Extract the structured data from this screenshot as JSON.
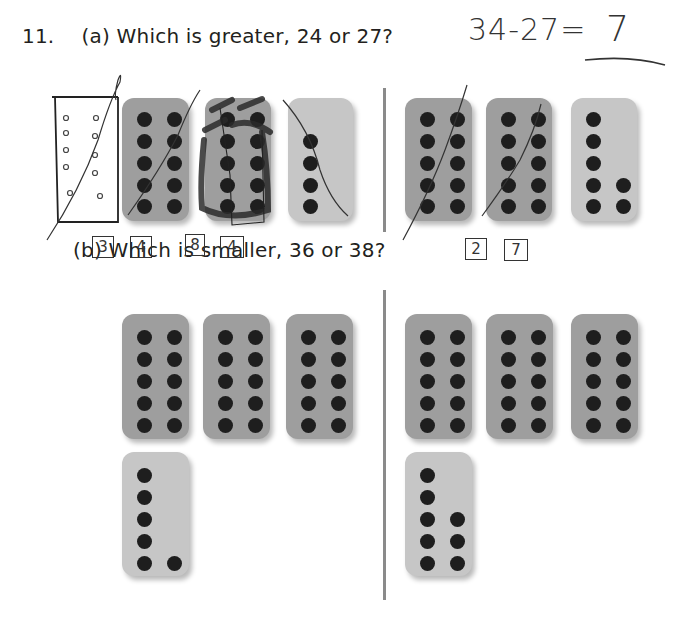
{
  "problem": {
    "number": "11.",
    "part_a": {
      "label": "(a)",
      "question": "Which is greater, 24 or 27?"
    },
    "part_b": {
      "label": "(b)",
      "question": "Which is smaller, 36 or 38?"
    }
  },
  "handwriting": {
    "equation": "34-27=",
    "answer": "7",
    "part_a_left_boxes": [
      "3",
      "4",
      "8",
      "4"
    ],
    "part_a_right_boxes": [
      "2",
      "7"
    ]
  },
  "cards": {
    "part_a_left": [
      {
        "type": "ten",
        "dots": 10
      },
      {
        "type": "ten",
        "dots": 10
      },
      {
        "type": "partial",
        "dots": 4
      }
    ],
    "part_a_right": [
      {
        "type": "ten",
        "dots": 10
      },
      {
        "type": "ten",
        "dots": 10
      },
      {
        "type": "partial",
        "dots": 7
      }
    ],
    "part_b_left": [
      {
        "type": "ten",
        "dots": 10
      },
      {
        "type": "ten",
        "dots": 10
      },
      {
        "type": "ten",
        "dots": 10
      },
      {
        "type": "partial",
        "dots": 6
      }
    ],
    "part_b_right": [
      {
        "type": "ten",
        "dots": 10
      },
      {
        "type": "ten",
        "dots": 10
      },
      {
        "type": "ten",
        "dots": 10
      },
      {
        "type": "partial",
        "dots": 8
      }
    ]
  },
  "colors": {
    "ten_card": "#9e9e9e",
    "partial_card": "#c6c6c6",
    "dot": "#1e1e1e",
    "divider": "#8a8a8a"
  }
}
